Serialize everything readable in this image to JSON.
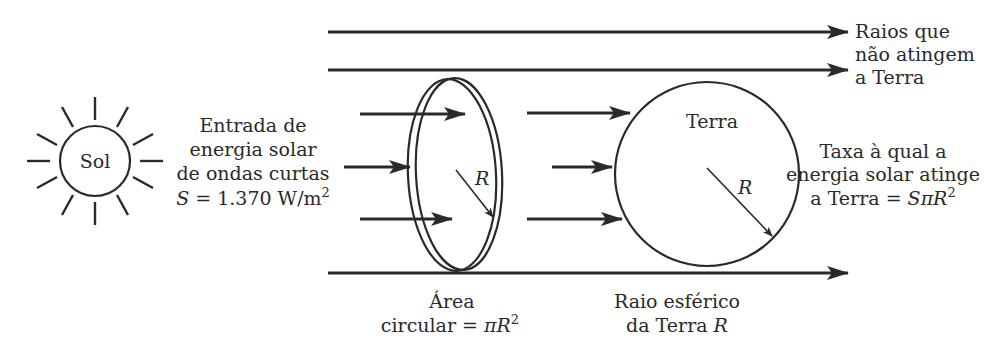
{
  "diagram": {
    "sun": {
      "label": "Sol"
    },
    "input_label": {
      "line1": "Entrada de",
      "line2": "energia solar",
      "line3": "de ondas curtas",
      "line4_symbol": "S",
      "line4_rest": " = 1.370 W/m",
      "line4_sup": "2"
    },
    "missed_rays_label": {
      "line1": "Raios que",
      "line2": "não atingem",
      "line3": "a Terra"
    },
    "disk": {
      "radius_label": "R",
      "caption_line1": "Área",
      "caption_line2_prefix": "circular = ",
      "caption_line2_pi": "π",
      "caption_line2_R": "R",
      "caption_line2_sup": "2"
    },
    "earth": {
      "label": "Terra",
      "radius_label": "R",
      "caption_line1": "Raio esférico",
      "caption_line2_prefix": "da Terra ",
      "caption_line2_R": "R"
    },
    "rate_label": {
      "line1": "Taxa à qual a",
      "line2": "energia solar atinge",
      "line3_prefix": "a Terra = ",
      "line3_formula": "SπR",
      "line3_sup": "2"
    },
    "colors": {
      "ink": "#2a2a2a",
      "background": "#ffffff"
    }
  }
}
